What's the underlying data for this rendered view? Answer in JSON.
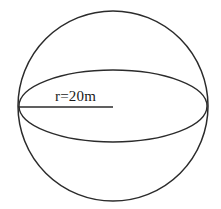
{
  "figure": {
    "kind": "sphere-diagram",
    "title": "",
    "background_color": "#ffffff",
    "stroke_color": "#2b2b2b",
    "label_color": "#1a1a1a"
  },
  "labels": {
    "radius": "r=20m"
  },
  "geometry": {
    "sphere": {
      "center_x": 113,
      "center_y": 106,
      "radius": 95
    },
    "equator_ellipse": {
      "center_x": 113,
      "center_y": 106,
      "semi_major_x": 94,
      "semi_minor_y": 36
    },
    "radius_line": {
      "x1": 18,
      "y1": 107,
      "x2": 113,
      "y2": 107
    },
    "radius_label_position": {
      "x": 55,
      "y": 101
    }
  },
  "measurements": {
    "radius_value": "20",
    "radius_unit": "m",
    "variable": "r"
  }
}
